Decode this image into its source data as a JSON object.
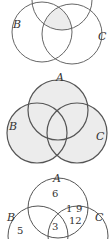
{
  "diagrams": [
    {
      "id": "venn-1",
      "labels": {
        "A": "A",
        "B": "B",
        "C": "C"
      },
      "shaded": "A∩B∩C (center region, bold outline)"
    },
    {
      "id": "venn-2",
      "labels": {
        "A": "A",
        "B": "B",
        "C": "C"
      },
      "shaded": "A∪B∪C (entire union)"
    },
    {
      "id": "venn-3",
      "labels": {
        "A": "A",
        "B": "B",
        "C": "C"
      },
      "regions": {
        "A_only": "6",
        "A_and_C_only_top": "1",
        "A_and_C_only_right": "9",
        "A_and_C_lower": "12",
        "A_B_C": "3",
        "B_only": "5"
      }
    }
  ],
  "colors": {
    "stroke": "#555555",
    "bold_stroke": "#222222",
    "fill": "#ececec"
  }
}
